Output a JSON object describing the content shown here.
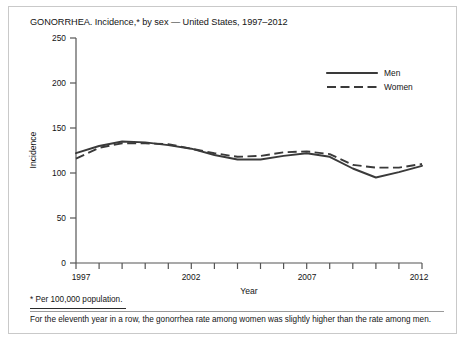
{
  "figure": {
    "title": "GONORRHEA. Incidence,* by sex — United States, 1997–2012",
    "footnote": "* Per 100,000 population.",
    "caption": "For the eleventh year in a row, the gonorrhea rate among women was slightly higher than the rate among men."
  },
  "chart_data": {
    "type": "line",
    "title": "GONORRHEA. Incidence,* by sex — United States, 1997–2012",
    "xlabel": "Year",
    "ylabel": "Incidence",
    "xlim": [
      1997,
      2012
    ],
    "ylim": [
      0,
      250
    ],
    "yticks": [
      0,
      50,
      100,
      150,
      200,
      250
    ],
    "ytick_labels": [
      "0",
      "50",
      "100",
      "150",
      "200",
      "250"
    ],
    "xticks": [
      1997,
      1998,
      1999,
      2000,
      2001,
      2002,
      2003,
      2004,
      2005,
      2006,
      2007,
      2008,
      2009,
      2010,
      2011,
      2012
    ],
    "xtick_labels": [
      "1997",
      "",
      "",
      "",
      "",
      "2002",
      "",
      "",
      "",
      "",
      "2007",
      "",
      "",
      "",
      "",
      "2012"
    ],
    "x": [
      1997,
      1998,
      1999,
      2000,
      2001,
      2002,
      2003,
      2004,
      2005,
      2006,
      2007,
      2008,
      2009,
      2010,
      2011,
      2012
    ],
    "grid": false,
    "legend_position": "top-right",
    "series": [
      {
        "name": "Men",
        "style": "solid",
        "color": "#3a3a3a",
        "values": [
          122,
          130,
          135,
          134,
          131,
          127,
          120,
          115,
          115,
          119,
          122,
          118,
          105,
          95,
          101,
          108
        ]
      },
      {
        "name": "Women",
        "style": "dashed",
        "color": "#3a3a3a",
        "values": [
          116,
          128,
          133,
          133,
          132,
          127,
          122,
          118,
          119,
          123,
          124,
          121,
          109,
          106,
          106,
          110
        ]
      }
    ]
  },
  "legend": {
    "items": [
      {
        "label": "Men"
      },
      {
        "label": "Women"
      }
    ]
  }
}
